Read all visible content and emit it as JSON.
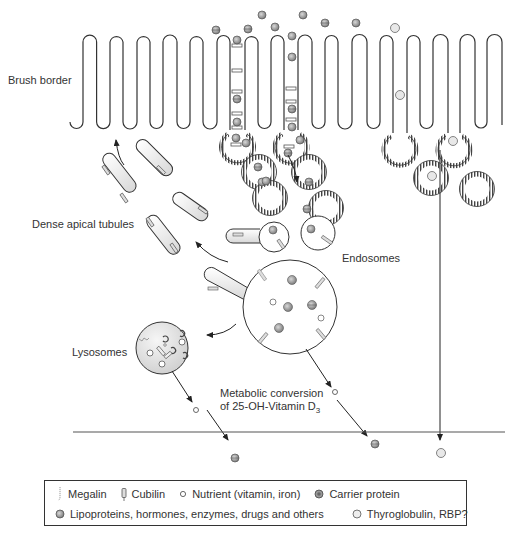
{
  "labels": {
    "brush_border": "Brush border",
    "dense_apical_tubules": "Dense apical tubules",
    "endosomes": "Endosomes",
    "lysosomes": "Lysosomes",
    "metabolic_line1": "Metabolic conversion",
    "metabolic_line2_prefix": "of 25-OH-Vitamin D",
    "metabolic_line2_sub": "3"
  },
  "legend": {
    "row1": [
      {
        "icon": "megalin-icon",
        "label": "Megalin"
      },
      {
        "icon": "cubilin-icon",
        "label": "Cubilin"
      },
      {
        "icon": "nutrient-icon",
        "label": "Nutrient (vitamin, iron)"
      },
      {
        "icon": "carrier-protein-icon",
        "label": "Carrier protein"
      }
    ],
    "row2": [
      {
        "icon": "lipoprotein-icon",
        "label": "Lipoproteins, hormones, enzymes, drugs and others"
      },
      {
        "icon": "thyroglobulin-icon",
        "label": "Thyroglobulin, RBP?"
      }
    ]
  },
  "colors": {
    "line": "#333333",
    "molecule_fill": "#9a9a9a",
    "lysosome_fill": "#e6e6e6",
    "receptor": "#888888"
  }
}
